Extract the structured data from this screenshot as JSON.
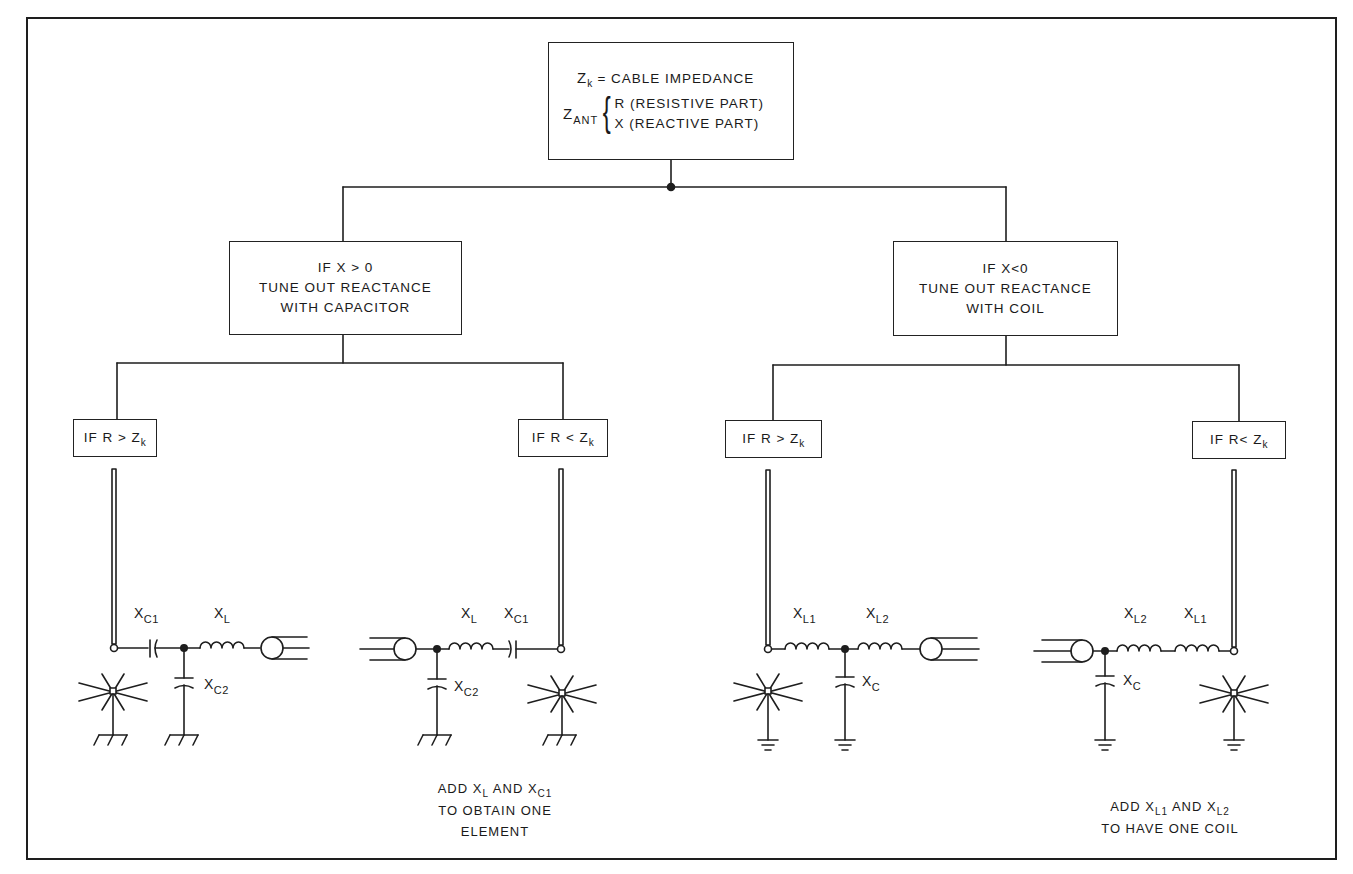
{
  "root": {
    "line1_symbol": "Z",
    "line1_symbol_sub": "k",
    "line1_text": "= CABLE IMPEDANCE",
    "zant_symbol": "Z",
    "zant_sub": "ANT",
    "brace": "{",
    "r_line": "R (RESISTIVE PART)",
    "x_line": "X (REACTIVE PART)"
  },
  "branches": {
    "left": {
      "line1": "IF X > 0",
      "line2": "TUNE OUT REACTANCE",
      "line3": "WITH CAPACITOR",
      "leaves": [
        {
          "cond_prefix": "IF R > Z",
          "cond_sub": "k"
        },
        {
          "cond_prefix": "IF R < Z",
          "cond_sub": "k"
        }
      ]
    },
    "right": {
      "line1": "IF X<0",
      "line2": "TUNE OUT REACTANCE",
      "line3": "WITH COIL",
      "leaves": [
        {
          "cond_prefix": "IF R > Z",
          "cond_sub": "k"
        },
        {
          "cond_prefix": "IF R< Z",
          "cond_sub": "k"
        }
      ]
    }
  },
  "circuits": [
    {
      "id": "cap-r-gt-zk",
      "labels": [
        {
          "base": "X",
          "sub": "C1"
        },
        {
          "base": "X",
          "sub": "L"
        },
        {
          "base": "X",
          "sub": "C2"
        }
      ],
      "ground_style": "hatched"
    },
    {
      "id": "cap-r-lt-zk",
      "labels": [
        {
          "base": "X",
          "sub": "L"
        },
        {
          "base": "X",
          "sub": "C1"
        },
        {
          "base": "X",
          "sub": "C2"
        }
      ],
      "ground_style": "hatched",
      "note": {
        "l1_a": "ADD X",
        "l1_a_sub": "L",
        "l1_b": " AND X",
        "l1_b_sub": "C1",
        "l2": "TO OBTAIN ONE",
        "l3": "ELEMENT"
      }
    },
    {
      "id": "coil-r-gt-zk",
      "labels": [
        {
          "base": "X",
          "sub": "L1"
        },
        {
          "base": "X",
          "sub": "L2"
        },
        {
          "base": "X",
          "sub": "C"
        }
      ],
      "ground_style": "earth"
    },
    {
      "id": "coil-r-lt-zk",
      "labels": [
        {
          "base": "X",
          "sub": "L2"
        },
        {
          "base": "X",
          "sub": "L1"
        },
        {
          "base": "X",
          "sub": "C"
        }
      ],
      "ground_style": "earth",
      "note": {
        "l1_a": "ADD X",
        "l1_a_sub": "L1",
        "l1_b": " AND X",
        "l1_b_sub": "L2",
        "l2": "TO HAVE ONE COIL"
      }
    }
  ],
  "colors": {
    "ink": "#1e1e1e",
    "paper": "#ffffff"
  }
}
